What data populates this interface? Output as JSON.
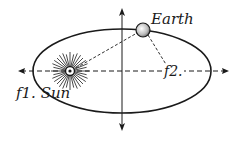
{
  "diagram": {
    "colors": {
      "ink": "#1a1a1a",
      "background": "#ffffff"
    },
    "labels": {
      "earth": "Earth",
      "sun_focus": "f1. Sun",
      "second_focus": "f2."
    },
    "elements": {
      "orbit": {
        "shape": "ellipse",
        "cx": 122,
        "cy": 71,
        "rx": 89,
        "ry": 42
      },
      "major_axis": {
        "style": "dashed",
        "arrows": [
          "left",
          "right"
        ]
      },
      "minor_axis": {
        "style": "solid",
        "arrows": [
          "up",
          "down"
        ]
      },
      "sun": {
        "x": 70,
        "y": 71,
        "focus": "f1"
      },
      "earth": {
        "x": 143,
        "y": 30
      },
      "focus_2": {
        "x": 168,
        "y": 71
      },
      "radius_lines": [
        "sun-to-earth",
        "earth-to-f2"
      ]
    }
  }
}
